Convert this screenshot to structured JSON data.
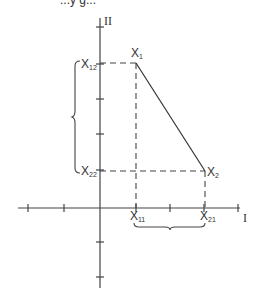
{
  "caption_partial": "...y g...",
  "axes": {
    "x_label": "I",
    "y_label": "II",
    "origin": [
      100,
      208
    ],
    "x_range_px": [
      18,
      240
    ],
    "y_range_px": [
      18,
      288
    ],
    "x_ticks_px": [
      28,
      64,
      136,
      170,
      204,
      238
    ],
    "y_ticks_px": [
      27,
      64,
      99,
      134,
      170,
      242,
      277
    ]
  },
  "points": {
    "x1": {
      "label": "X",
      "sub": "1",
      "px": [
        136,
        63
      ]
    },
    "x2": {
      "label": "X",
      "sub": "2",
      "px": [
        205,
        171
      ]
    }
  },
  "axis_labels": {
    "x11": {
      "label": "X",
      "sub": "11"
    },
    "x21": {
      "label": "X",
      "sub": "21"
    },
    "x12": {
      "label": "X",
      "sub": "12"
    },
    "x22": {
      "label": "X",
      "sub": "22"
    }
  },
  "braces": {
    "vertical": {
      "from_y": 61,
      "to_y": 173,
      "x": 78
    },
    "horizontal": {
      "from_x": 134,
      "to_x": 205,
      "y": 226
    }
  },
  "colors": {
    "stroke": "#333333",
    "background": "#ffffff"
  }
}
